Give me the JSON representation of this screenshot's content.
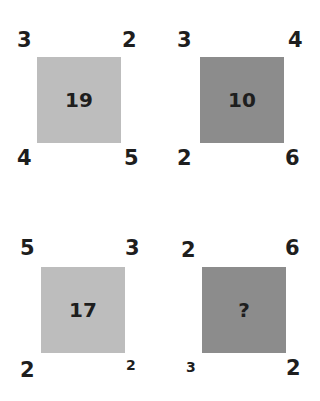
{
  "puzzle": [
    {
      "center": "19",
      "shade": "light",
      "tl": "3",
      "tr": "2",
      "bl": "4",
      "br": "5"
    },
    {
      "center": "10",
      "shade": "dark",
      "tl": "3",
      "tr": "4",
      "bl": "2",
      "br": "6"
    },
    {
      "center": "17",
      "shade": "light",
      "tl": "5",
      "tr": "3",
      "bl": "2",
      "br": "2"
    },
    {
      "center": "?",
      "shade": "dark",
      "tl": "2",
      "tr": "6",
      "bl": "3",
      "br": "2"
    }
  ],
  "colors": {
    "light": "#bdbdbd",
    "dark": "#8c8c8c",
    "text": "#1e1e1e"
  }
}
